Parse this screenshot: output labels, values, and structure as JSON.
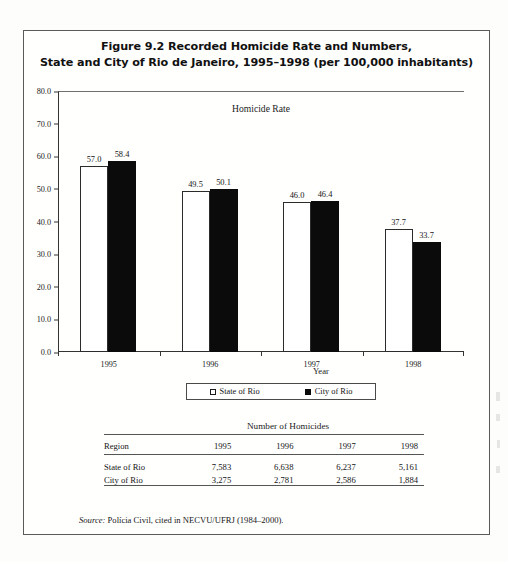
{
  "figure": {
    "title_line1": "Figure 9.2  Recorded Homicide Rate and Numbers,",
    "title_line2": "State and City of Rio de Janeiro, 1995–1998 (per 100,000 inhabitants)"
  },
  "chart_data": {
    "type": "bar",
    "title": "Homicide Rate",
    "xlabel": "Year",
    "ylabel": "",
    "ylim": [
      0.0,
      80.0
    ],
    "yticks": [
      "0.0",
      "10.0",
      "20.0",
      "30.0",
      "40.0",
      "50.0",
      "60.0",
      "70.0",
      "80.0"
    ],
    "ytick_values": [
      0.0,
      10.0,
      20.0,
      30.0,
      40.0,
      50.0,
      60.0,
      70.0,
      80.0
    ],
    "grid": false,
    "legend_position": "bottom",
    "categories": [
      "1995",
      "1996",
      "1997",
      "1998"
    ],
    "series": [
      {
        "name": "State of Rio",
        "color": "#ffffff",
        "edge_color": "#2b2b2b",
        "values": [
          57.0,
          49.5,
          46.0,
          37.7
        ],
        "labels": [
          "57.0",
          "49.5",
          "46.0",
          "37.7"
        ]
      },
      {
        "name": "City of Rio",
        "color": "#0b0b0b",
        "edge_color": "#0b0b0b",
        "values": [
          58.4,
          50.1,
          46.4,
          33.7
        ],
        "labels": [
          "58.4",
          "50.1",
          "46.4",
          "33.7"
        ]
      }
    ]
  },
  "legend": {
    "items": [
      {
        "label": "State of Rio",
        "swatch": "open"
      },
      {
        "label": "City of Rio",
        "swatch": "filled"
      }
    ]
  },
  "table": {
    "caption": "Number of Homicides",
    "region_header": "Region",
    "year_headers": [
      "1995",
      "1996",
      "1997",
      "1998"
    ],
    "rows": [
      {
        "region": "State of Rio",
        "values": [
          "7,583",
          "6,638",
          "6,237",
          "5,161"
        ]
      },
      {
        "region": "City of Rio",
        "values": [
          "3,275",
          "2,781",
          "2,586",
          "1,884"
        ]
      }
    ]
  },
  "source": {
    "label": "Source:",
    "text": " Polícia Civil, cited in NECVU/UFRJ (1984–2000)."
  }
}
